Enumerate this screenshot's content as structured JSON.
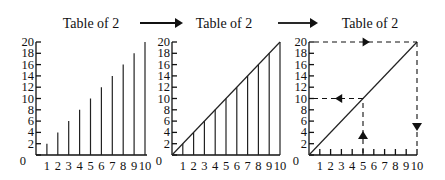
{
  "panels": [
    {
      "id": "bars",
      "title": "Table of 2",
      "style": "vertical-lines"
    },
    {
      "id": "bars-with-line",
      "title": "Table of 2",
      "style": "vertical-lines-with-line"
    },
    {
      "id": "line-lookup",
      "title": "Table of 2",
      "style": "line-with-lookup-arrows"
    }
  ],
  "flow_arrows": [
    "arrow-right",
    "arrow-right"
  ],
  "chart_data": [
    {
      "type": "bar",
      "title": "Table of 2",
      "x": [
        1,
        2,
        3,
        4,
        5,
        6,
        7,
        8,
        9,
        10
      ],
      "values": [
        2,
        4,
        6,
        8,
        10,
        12,
        14,
        16,
        18,
        20
      ],
      "xlabel": "",
      "ylabel": "",
      "xlim": [
        0,
        10
      ],
      "ylim": [
        0,
        20
      ],
      "x_ticks": [
        "1",
        "2",
        "3",
        "4",
        "5",
        "6",
        "7",
        "8",
        "9",
        "10"
      ],
      "y_ticks": [
        "0",
        "2",
        "4",
        "6",
        "8",
        "10",
        "12",
        "14",
        "16",
        "18",
        "20"
      ],
      "grid": false
    },
    {
      "type": "line",
      "title": "Table of 2",
      "x": [
        0,
        1,
        2,
        3,
        4,
        5,
        6,
        7,
        8,
        9,
        10
      ],
      "values": [
        0,
        2,
        4,
        6,
        8,
        10,
        12,
        14,
        16,
        18,
        20
      ],
      "drop_lines": true,
      "xlim": [
        0,
        10
      ],
      "ylim": [
        0,
        20
      ],
      "x_ticks": [
        "1",
        "2",
        "3",
        "4",
        "5",
        "6",
        "7",
        "8",
        "9",
        "10"
      ],
      "y_ticks": [
        "0",
        "2",
        "4",
        "6",
        "8",
        "10",
        "12",
        "14",
        "16",
        "18",
        "20"
      ],
      "grid": false
    },
    {
      "type": "line",
      "title": "Table of 2",
      "x": [
        0,
        10
      ],
      "values": [
        0,
        20
      ],
      "annotations": [
        {
          "kind": "dashed-lookup",
          "from_x": 5,
          "to_y": 10,
          "description": "up from x=5 to line, left to y=10"
        },
        {
          "kind": "dashed-lookup",
          "from_y": 20,
          "to_x": 10,
          "description": "right along y=20, down to x=10"
        }
      ],
      "xlim": [
        0,
        10
      ],
      "ylim": [
        0,
        20
      ],
      "x_ticks": [
        "1",
        "2",
        "3",
        "4",
        "5",
        "6",
        "7",
        "8",
        "9",
        "10"
      ],
      "y_ticks": [
        "0",
        "2",
        "4",
        "6",
        "8",
        "10",
        "12",
        "14",
        "16",
        "18",
        "20"
      ],
      "grid": false
    }
  ]
}
